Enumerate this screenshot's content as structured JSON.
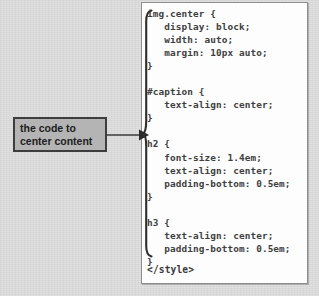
{
  "page": {
    "background_color": "#d8d8d8",
    "width": 319,
    "height": 296
  },
  "callout": {
    "name": "annotation-callout",
    "fill_color": "#b4b4b4",
    "border_color": "#3d3d3d",
    "text_color": "#1d1d1d",
    "lines": [
      "the code to",
      "center content"
    ],
    "arrow": {
      "name": "callout-arrow",
      "direction": "right",
      "points_to": "h2-rule-block"
    }
  },
  "code_panel": {
    "name": "css-code-panel",
    "background_color": "#fdfdfd",
    "border_color": "#8e8e8e",
    "text_color": "#40403f",
    "language": "css",
    "brace": {
      "name": "grouping-brace",
      "glyph": "{",
      "spans_lines": "img.center through h3 closing brace"
    },
    "body": "img.center {\n   display: block;\n   width: auto;\n   margin: 10px auto;\n}\n\n#caption {\n   text-align: center;\n}\n\nh2 {\n   font-size: 1.4em;\n   text-align: center;\n   padding-bottom: 0.5em;\n}\n\nh3 {\n   text-align: center;\n   padding-bottom: 0.5em;\n}",
    "closing_tag": "</style>",
    "rules": [
      {
        "selector": "img.center",
        "declarations": [
          "display: block;",
          "width: auto;",
          "margin: 10px auto;"
        ]
      },
      {
        "selector": "#caption",
        "declarations": [
          "text-align: center;"
        ]
      },
      {
        "selector": "h2",
        "declarations": [
          "font-size: 1.4em;",
          "text-align: center;",
          "padding-bottom: 0.5em;"
        ]
      },
      {
        "selector": "h3",
        "declarations": [
          "text-align: center;",
          "padding-bottom: 0.5em;"
        ]
      }
    ]
  }
}
